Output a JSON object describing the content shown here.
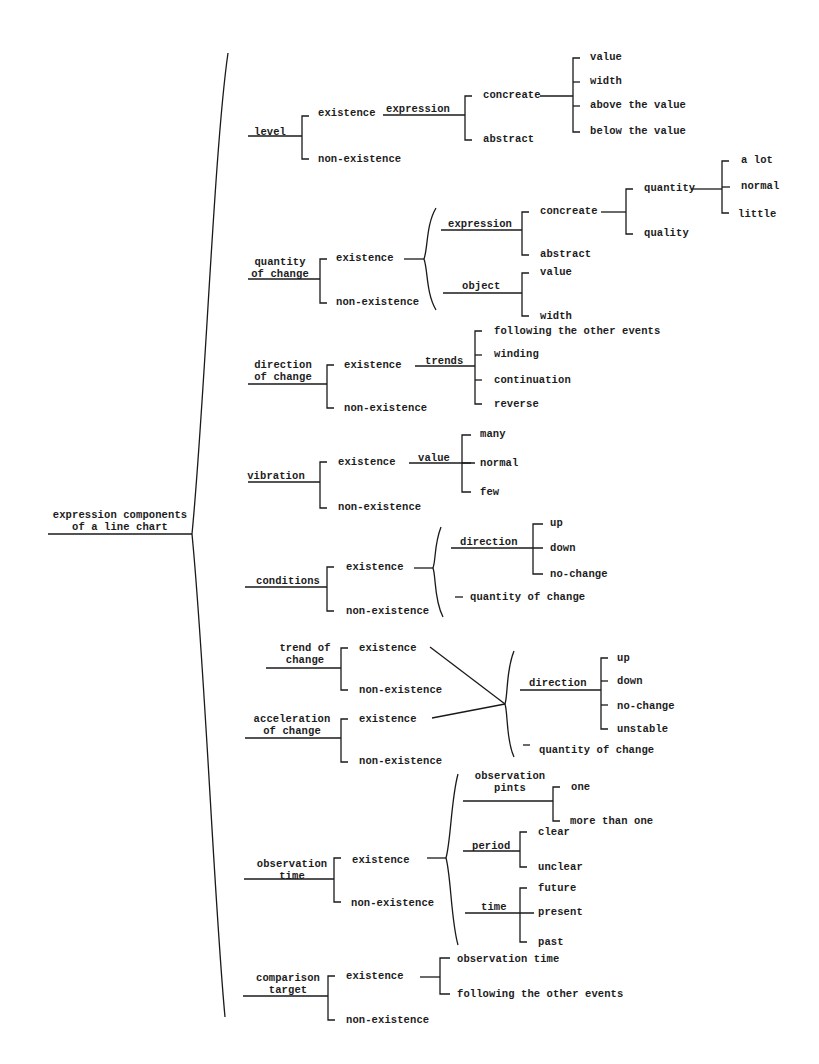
{
  "diagram": {
    "title": "expression components of a line chart",
    "root": {
      "label": "expression components\nof a line chart",
      "x": 120,
      "y": 499
    },
    "nodes": [
      {
        "id": "level",
        "label": "level",
        "x": 270,
        "y": 126,
        "center": true
      },
      {
        "id": "level-exist",
        "label": "existence",
        "x": 318,
        "y": 107
      },
      {
        "id": "level-nonexist",
        "label": "non-existence",
        "x": 318,
        "y": 153
      },
      {
        "id": "level-expression",
        "label": "expression",
        "x": 386,
        "y": 103
      },
      {
        "id": "level-concreate",
        "label": "concreate",
        "x": 483,
        "y": 89
      },
      {
        "id": "level-abstract",
        "label": "abstract",
        "x": 483,
        "y": 133
      },
      {
        "id": "level-value",
        "label": "value",
        "x": 590,
        "y": 51
      },
      {
        "id": "level-width",
        "label": "width",
        "x": 590,
        "y": 75
      },
      {
        "id": "level-above",
        "label": "above the value",
        "x": 590,
        "y": 99
      },
      {
        "id": "level-below",
        "label": "below the value",
        "x": 590,
        "y": 125
      },
      {
        "id": "qoc",
        "label": "quantity\nof change",
        "x": 280,
        "y": 256,
        "center": true
      },
      {
        "id": "qoc-exist",
        "label": "existence",
        "x": 336,
        "y": 252
      },
      {
        "id": "qoc-nonexist",
        "label": "non-existence",
        "x": 336,
        "y": 296
      },
      {
        "id": "qoc-expression",
        "label": "expression",
        "x": 448,
        "y": 218
      },
      {
        "id": "qoc-concreate",
        "label": "concreate",
        "x": 540,
        "y": 205
      },
      {
        "id": "qoc-abstract",
        "label": "abstract",
        "x": 540,
        "y": 248
      },
      {
        "id": "qoc-quantity",
        "label": "quantity",
        "x": 644,
        "y": 182
      },
      {
        "id": "qoc-quality",
        "label": "quality",
        "x": 644,
        "y": 227
      },
      {
        "id": "qoc-alot",
        "label": "a lot",
        "x": 741,
        "y": 154
      },
      {
        "id": "qoc-normal",
        "label": "normal",
        "x": 741,
        "y": 180
      },
      {
        "id": "qoc-little",
        "label": "little",
        "x": 738,
        "y": 208
      },
      {
        "id": "qoc-object",
        "label": "object",
        "x": 462,
        "y": 280
      },
      {
        "id": "qoc-value",
        "label": "value",
        "x": 540,
        "y": 266
      },
      {
        "id": "qoc-width",
        "label": "width",
        "x": 540,
        "y": 310
      },
      {
        "id": "doc",
        "label": "direction\nof change",
        "x": 283,
        "y": 359,
        "center": true
      },
      {
        "id": "doc-exist",
        "label": "existence",
        "x": 344,
        "y": 359
      },
      {
        "id": "doc-nonexist",
        "label": "non-existence",
        "x": 344,
        "y": 402
      },
      {
        "id": "doc-trends",
        "label": "trends",
        "x": 425,
        "y": 355
      },
      {
        "id": "doc-following",
        "label": "following the other events",
        "x": 494,
        "y": 325
      },
      {
        "id": "doc-winding",
        "label": "winding",
        "x": 494,
        "y": 348
      },
      {
        "id": "doc-continuation",
        "label": "continuation",
        "x": 494,
        "y": 374
      },
      {
        "id": "doc-reverse",
        "label": "reverse",
        "x": 494,
        "y": 398
      },
      {
        "id": "vib",
        "label": "vibration",
        "x": 276,
        "y": 470,
        "center": true
      },
      {
        "id": "vib-exist",
        "label": "existence",
        "x": 338,
        "y": 456
      },
      {
        "id": "vib-nonexist",
        "label": "non-existence",
        "x": 338,
        "y": 501
      },
      {
        "id": "vib-value",
        "label": "value",
        "x": 418,
        "y": 452
      },
      {
        "id": "vib-many",
        "label": "many",
        "x": 480,
        "y": 428
      },
      {
        "id": "vib-normal",
        "label": "normal",
        "x": 480,
        "y": 457
      },
      {
        "id": "vib-few",
        "label": "few",
        "x": 480,
        "y": 486
      },
      {
        "id": "cond",
        "label": "conditions",
        "x": 288,
        "y": 575,
        "center": true
      },
      {
        "id": "cond-exist",
        "label": "existence",
        "x": 346,
        "y": 561
      },
      {
        "id": "cond-nonexist",
        "label": "non-existence",
        "x": 346,
        "y": 605
      },
      {
        "id": "cond-direction",
        "label": "direction",
        "x": 460,
        "y": 536
      },
      {
        "id": "cond-up",
        "label": "up",
        "x": 550,
        "y": 517
      },
      {
        "id": "cond-down",
        "label": "down",
        "x": 550,
        "y": 542
      },
      {
        "id": "cond-nochange",
        "label": "no-change",
        "x": 550,
        "y": 568
      },
      {
        "id": "cond-qoc",
        "label": "quantity of change",
        "x": 470,
        "y": 591
      },
      {
        "id": "toc",
        "label": "trend of\nchange",
        "x": 305,
        "y": 642,
        "center": true
      },
      {
        "id": "toc-exist",
        "label": "existence",
        "x": 359,
        "y": 642
      },
      {
        "id": "toc-nonexist",
        "label": "non-existence",
        "x": 359,
        "y": 684
      },
      {
        "id": "aoc",
        "label": "acceleration\nof change",
        "x": 292,
        "y": 713,
        "center": true
      },
      {
        "id": "aoc-exist",
        "label": "existence",
        "x": 359,
        "y": 713
      },
      {
        "id": "aoc-nonexist",
        "label": "non-existence",
        "x": 359,
        "y": 755
      },
      {
        "id": "tac-direction",
        "label": "direction",
        "x": 529,
        "y": 677
      },
      {
        "id": "tac-up",
        "label": "up",
        "x": 617,
        "y": 652
      },
      {
        "id": "tac-down",
        "label": "down",
        "x": 617,
        "y": 675
      },
      {
        "id": "tac-nochange",
        "label": "no-change",
        "x": 617,
        "y": 700
      },
      {
        "id": "tac-unstable",
        "label": "unstable",
        "x": 617,
        "y": 723
      },
      {
        "id": "tac-qoc",
        "label": "quantity of change",
        "x": 539,
        "y": 744
      },
      {
        "id": "ot",
        "label": "observation\ntime",
        "x": 292,
        "y": 858,
        "center": true
      },
      {
        "id": "ot-exist",
        "label": "existence",
        "x": 352,
        "y": 854
      },
      {
        "id": "ot-nonexist",
        "label": "non-existence",
        "x": 351,
        "y": 897
      },
      {
        "id": "ot-obspints",
        "label": "observation\npints",
        "x": 510,
        "y": 770,
        "center": true
      },
      {
        "id": "ot-one",
        "label": "one",
        "x": 571,
        "y": 781
      },
      {
        "id": "ot-morethanone",
        "label": "more than one",
        "x": 570,
        "y": 815
      },
      {
        "id": "ot-period",
        "label": "period",
        "x": 472,
        "y": 840
      },
      {
        "id": "ot-clear",
        "label": "clear",
        "x": 538,
        "y": 826
      },
      {
        "id": "ot-unclear",
        "label": "unclear",
        "x": 538,
        "y": 861
      },
      {
        "id": "ot-time",
        "label": "time",
        "x": 481,
        "y": 901
      },
      {
        "id": "ot-future",
        "label": "future",
        "x": 538,
        "y": 882
      },
      {
        "id": "ot-present",
        "label": "present",
        "x": 538,
        "y": 906
      },
      {
        "id": "ot-past",
        "label": "past",
        "x": 538,
        "y": 936
      },
      {
        "id": "ct",
        "label": "comparison\ntarget",
        "x": 288,
        "y": 972,
        "center": true
      },
      {
        "id": "ct-exist",
        "label": "existence",
        "x": 346,
        "y": 970
      },
      {
        "id": "ct-nonexist",
        "label": "non-existence",
        "x": 346,
        "y": 1014
      },
      {
        "id": "ct-obstime",
        "label": "observation time",
        "x": 457,
        "y": 953
      },
      {
        "id": "ct-following",
        "label": "following the other events",
        "x": 457,
        "y": 988
      }
    ]
  }
}
